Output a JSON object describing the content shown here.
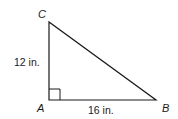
{
  "figure": {
    "type": "right-triangle",
    "vertices": {
      "A": {
        "label": "A",
        "x": 49,
        "y": 100
      },
      "B": {
        "label": "B",
        "x": 156,
        "y": 100
      },
      "C": {
        "label": "C",
        "x": 49,
        "y": 22
      }
    },
    "sides": {
      "AC": {
        "label": "12 in."
      },
      "AB": {
        "label": "16 in."
      }
    },
    "right_angle_at": "A",
    "stroke_color": "#1a1a1a"
  }
}
